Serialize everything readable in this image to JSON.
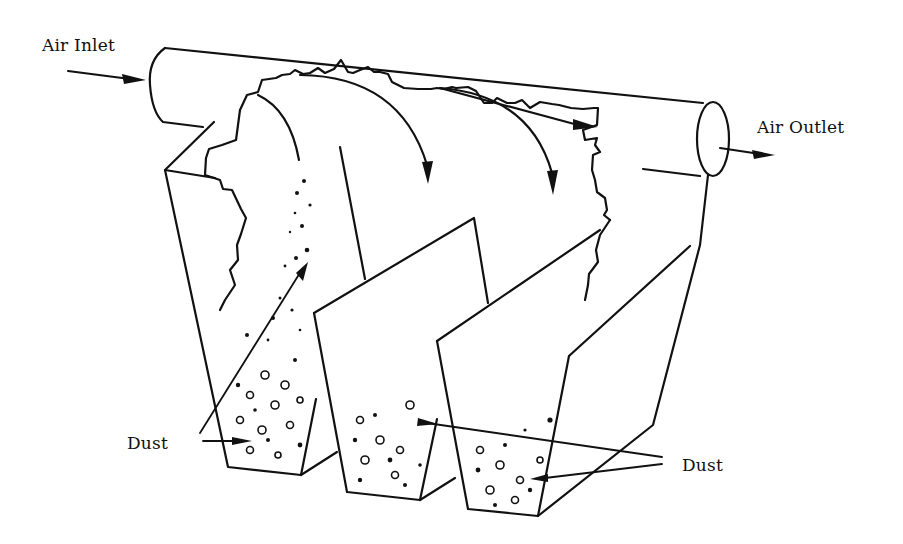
{
  "diagram": {
    "labels": {
      "air_inlet": "Air Inlet",
      "air_outlet": "Air Outlet",
      "dust_left": "Dust",
      "dust_right": "Dust"
    },
    "components": [
      "inlet duct",
      "settling hoppers (3)",
      "outlet duct",
      "airflow arrows",
      "collected dust"
    ],
    "colors": {
      "line": "#111111",
      "background": "#ffffff"
    }
  }
}
